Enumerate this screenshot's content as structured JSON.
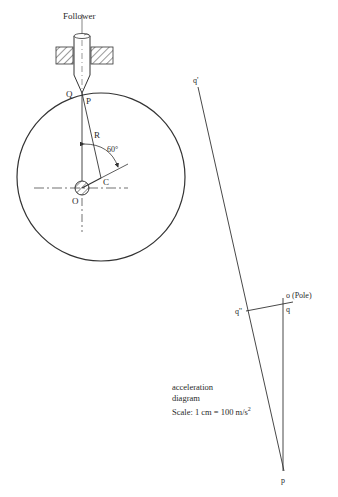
{
  "mechanism": {
    "follower_label": "Follower",
    "points": {
      "Q": "Q",
      "P": "P",
      "R": "R",
      "C": "C",
      "O": "O"
    },
    "angle_label": "60°",
    "cam_circle": {
      "cx": 101,
      "cy": 177,
      "r": 84
    }
  },
  "acceleration_diagram": {
    "points": {
      "q_prime": "q'",
      "q_double_prime": "q''",
      "o": "o",
      "pole": "(Pole)",
      "q": "q",
      "p": "p"
    },
    "caption_line1": "acceleration",
    "caption_line2": "diagram",
    "scale_text": "Scale: 1 cm = 100 m/s",
    "scale_exp": "2"
  },
  "colors": {
    "line": "#333333",
    "background": "#ffffff"
  }
}
